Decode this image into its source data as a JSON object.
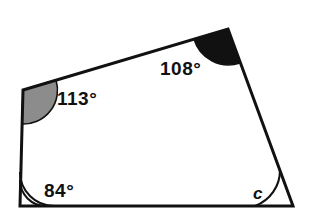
{
  "figure": {
    "kind": "quadrilateral-angle-diagram",
    "background_color": "#ffffff",
    "outline_color": "#111111",
    "outline_width": 3,
    "vertices": {
      "top_left": {
        "x": 23,
        "y": 90
      },
      "top_right": {
        "x": 228,
        "y": 29
      },
      "bottom_right": {
        "x": 293,
        "y": 206
      },
      "bottom_left": {
        "x": 20,
        "y": 206
      }
    },
    "angles": [
      {
        "id": "top-left",
        "label": "113°",
        "value": 113,
        "unit": "degrees",
        "marker": "filled-sector",
        "marker_fill": "#8c8c8c",
        "marker_stroke": "#111111",
        "known": true
      },
      {
        "id": "top-right",
        "label": "108°",
        "value": 108,
        "unit": "degrees",
        "marker": "filled-sector",
        "marker_fill": "#111111",
        "marker_stroke": "#111111",
        "known": true
      },
      {
        "id": "bottom-left",
        "label": "84°",
        "value": 84,
        "unit": "degrees",
        "marker": "double-arc",
        "marker_fill": "none",
        "marker_stroke": "#111111",
        "known": true
      },
      {
        "id": "bottom-right",
        "label": "c",
        "value": null,
        "unit": "degrees",
        "marker": "single-arc",
        "marker_fill": "none",
        "marker_stroke": "#111111",
        "known": false
      }
    ]
  }
}
